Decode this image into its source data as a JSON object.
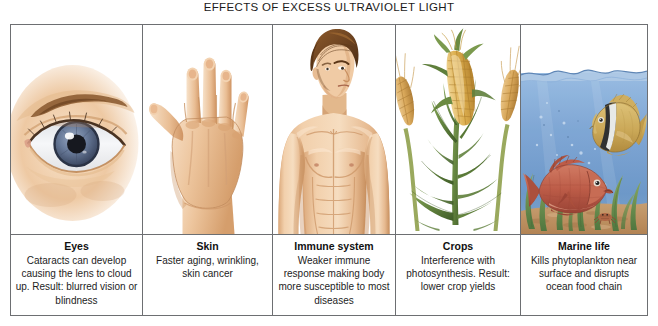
{
  "title": "EFFECTS OF EXCESS ULTRAVIOLET LIGHT",
  "panels": [
    {
      "id": "eyes",
      "heading": "Eyes",
      "body": "Cataracts can develop causing the lens to cloud up. Result: blurred vision or blindness",
      "illustration": "human-eye-closeup"
    },
    {
      "id": "skin",
      "heading": "Skin",
      "body": "Faster aging, wrinkling, skin cancer",
      "illustration": "back-of-hand"
    },
    {
      "id": "immune-system",
      "heading": "Immune system",
      "body": "Weaker immune response making body more susceptible to most diseases",
      "illustration": "male-torso"
    },
    {
      "id": "crops",
      "heading": "Crops",
      "body": "Interference with photosynthesis. Result: lower crop yields",
      "illustration": "corn-and-wheat"
    },
    {
      "id": "marine-life",
      "heading": "Marine life",
      "body": "Kills phytoplankton near surface and disrupts ocean food chain",
      "illustration": "underwater-fish-scene"
    }
  ],
  "colors": {
    "frame_line": "#6d6f72",
    "skin_light": "#f7ddc3",
    "skin_mid": "#e8b98d",
    "skin_shadow": "#c98f5d",
    "hair_brown": "#7b4a22",
    "iris_blue": "#6c7f9e",
    "water_blue": "#7fa7d4",
    "water_deep": "#5d8cc0",
    "seaweed_green": "#6f9145",
    "sand": "#d8a86b",
    "fish_yellow": "#d9b255",
    "fish_red": "#c4593f",
    "corn_yellow": "#dcae4e",
    "leaf_green": "#5f7f3c",
    "wheat_tan": "#d9a85a"
  }
}
